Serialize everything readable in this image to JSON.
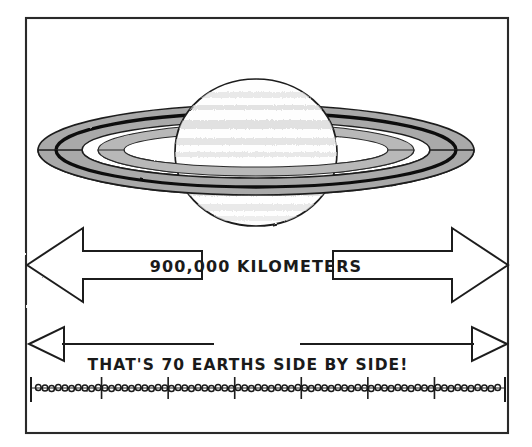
{
  "illustration": {
    "title": "Saturn size comparison diagram",
    "style": "hand-drawn pen and ink sketch",
    "background_color": "#ffffff",
    "frame": {
      "name": "border-frame",
      "stroke_color": "#1a1a1a",
      "x": 26,
      "y": 18,
      "width": 482,
      "height": 415
    },
    "planet": {
      "name": "saturn",
      "body_label": "Saturn planet body",
      "body_fill": "#fdfdfd",
      "band_fill": "#d8d8d8",
      "outline_color": "#1a1a1a",
      "center_x": 256,
      "center_y": 152,
      "radius_x": 80,
      "radius_y": 73,
      "bands": 7
    },
    "rings": {
      "name": "saturn-rings",
      "outer_fill": "#a8a8a8",
      "inner_fill": "#b4b4b4",
      "gap_fill": "#ffffff",
      "division_line_color": "#111111",
      "outline_color": "#1a1a1a",
      "center_x": 256,
      "center_y": 150,
      "outer_radius_x": 218,
      "outer_radius_y": 45
    },
    "measure_arrow": {
      "name": "width-measure-arrow",
      "type": "double-headed-block-arrow",
      "label": "900,000 KILOMETERS",
      "stroke_color": "#1a1a1a",
      "fill": "#ffffff",
      "y_center": 265,
      "left_tip_x": 27,
      "right_tip_x": 508
    },
    "earths_arrow": {
      "name": "earths-measure-arrow",
      "type": "double-headed-thin-arrow",
      "label": "THAT'S 70 EARTHS SIDE BY SIDE!",
      "stroke_color": "#1a1a1a",
      "fill": "#ffffff",
      "y_center": 344,
      "left_tip_x": 29,
      "right_tip_x": 507
    },
    "earth_ruler": {
      "name": "earth-count-ruler",
      "description": "row of 70 tiny circles representing Earths",
      "earth_count": 70,
      "tick_group_size": 10,
      "tick_count": 8,
      "circle_color": "#1a1a1a",
      "baseline_color": "#1a1a1a",
      "y_center": 388,
      "start_x": 32,
      "end_x": 504
    }
  },
  "texts": {
    "kilometers_label": "900,000 KILOMETERS",
    "earths_label": "THAT'S 70 EARTHS SIDE BY SIDE!"
  }
}
